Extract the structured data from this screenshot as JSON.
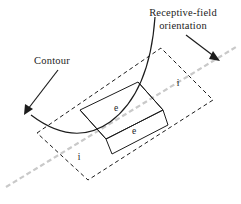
{
  "figure": {
    "background_color": "#ffffff",
    "ink_color": "#1c1c1c",
    "axis_color": "#c9c9c9"
  },
  "callouts": [
    {
      "id": "receptive-field-orientation",
      "line1": "Receptive-field",
      "line2": "orientation",
      "points_to": "orientation-axis"
    },
    {
      "id": "contour",
      "line1": "Contour",
      "line2": "",
      "points_to": "contour-arc"
    }
  ],
  "regions": [
    {
      "id": "inhibitory-right",
      "label": "i",
      "type": "inhibitory",
      "border": "dashed"
    },
    {
      "id": "inhibitory-left",
      "label": "i",
      "type": "inhibitory",
      "border": "dashed"
    },
    {
      "id": "excitatory-upper",
      "label": "e",
      "type": "excitatory",
      "border": "solid"
    },
    {
      "id": "excitatory-lower",
      "label": "e",
      "type": "excitatory",
      "border": "solid"
    }
  ],
  "elements": {
    "orientation_axis_name": "orientation-axis",
    "contour_name": "contour-arc",
    "receptive_field_name": "receptive-field-outline"
  }
}
